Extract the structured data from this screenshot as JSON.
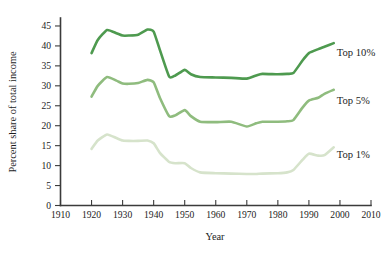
{
  "chart_data": {
    "type": "line",
    "title": "",
    "subtitle": "",
    "xlabel": "Year",
    "ylabel": "Percent share of total income",
    "xlim": [
      1910,
      2010
    ],
    "ylim": [
      0,
      47
    ],
    "xticks": [
      1910,
      1920,
      1930,
      1940,
      1950,
      1960,
      1970,
      1980,
      1990,
      2000,
      2010
    ],
    "yticks": [
      0,
      5,
      10,
      15,
      20,
      25,
      30,
      35,
      40,
      45
    ],
    "grid": false,
    "legend_position": "inline-right-annotations",
    "series": [
      {
        "name": "Top 10%",
        "color": "#4E9A4F",
        "annotation": "Top 10%",
        "annotation_x": 1999,
        "annotation_y": 37.5,
        "x": [
          1920,
          1922,
          1925,
          1928,
          1930,
          1932,
          1935,
          1938,
          1940,
          1942,
          1945,
          1947,
          1950,
          1952,
          1955,
          1960,
          1965,
          1970,
          1973,
          1975,
          1980,
          1983,
          1985,
          1988,
          1990,
          1993,
          1995,
          1998
        ],
        "values": [
          38.2,
          41.5,
          44.0,
          43.2,
          42.6,
          42.6,
          42.8,
          44.1,
          43.6,
          39.0,
          32.3,
          32.6,
          34.0,
          32.9,
          32.2,
          32.1,
          32.0,
          31.8,
          32.6,
          33.0,
          32.9,
          33.0,
          33.2,
          36.4,
          38.2,
          39.2,
          39.8,
          40.7
        ]
      },
      {
        "name": "Top 5%",
        "color": "#8FBC7E",
        "annotation": "Top 5%",
        "annotation_x": 1999,
        "annotation_y": 25.5,
        "x": [
          1920,
          1922,
          1925,
          1928,
          1930,
          1932,
          1935,
          1938,
          1940,
          1942,
          1945,
          1947,
          1950,
          1952,
          1955,
          1960,
          1965,
          1970,
          1973,
          1975,
          1980,
          1983,
          1985,
          1988,
          1990,
          1993,
          1995,
          1998
        ],
        "values": [
          27.3,
          30.0,
          32.2,
          31.3,
          30.6,
          30.5,
          30.7,
          31.5,
          30.9,
          27.0,
          22.4,
          22.6,
          23.9,
          22.4,
          21.0,
          20.9,
          21.0,
          19.8,
          20.6,
          21.0,
          21.0,
          21.1,
          21.4,
          24.6,
          26.3,
          27.0,
          28.0,
          29.0
        ]
      },
      {
        "name": "Top 1%",
        "color": "#D6E3CB",
        "annotation": "Top 1%",
        "annotation_x": 1999,
        "annotation_y": 12.0,
        "x": [
          1920,
          1922,
          1925,
          1928,
          1930,
          1932,
          1935,
          1938,
          1940,
          1942,
          1945,
          1947,
          1950,
          1952,
          1955,
          1960,
          1965,
          1970,
          1973,
          1975,
          1980,
          1983,
          1985,
          1988,
          1990,
          1993,
          1995,
          1998
        ],
        "values": [
          14.2,
          16.3,
          17.8,
          16.9,
          16.3,
          16.2,
          16.2,
          16.3,
          15.6,
          13.2,
          10.9,
          10.6,
          10.6,
          9.4,
          8.3,
          8.1,
          8.0,
          7.9,
          7.9,
          8.0,
          8.1,
          8.3,
          8.9,
          11.5,
          13.0,
          12.5,
          12.6,
          14.6
        ]
      }
    ]
  }
}
